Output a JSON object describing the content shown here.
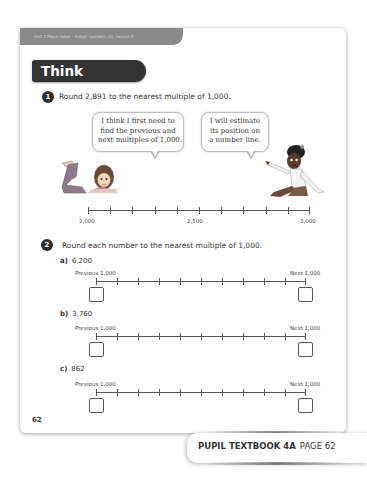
{
  "header": {
    "unit_label": "Unit 2  Place value – 4-digit numbers (2), Lesson 5",
    "section_title": "Think together"
  },
  "question1": {
    "number": "1",
    "text": "Round 2,891 to the nearest multiple of 1,000.",
    "bubble_left": {
      "lines": [
        "I think I first need to",
        "find the previous and",
        "next multiples of 1,000."
      ]
    },
    "bubble_right": {
      "lines": [
        "I will estimate",
        "its position on",
        "a number line."
      ]
    },
    "number_line": {
      "start_label": "2,000",
      "mid_label": "2,500",
      "end_label": "3,000",
      "tick_count": 11
    },
    "characters": [
      "girl-lying-character",
      "girl-pointing-character"
    ]
  },
  "question2": {
    "number": "2",
    "text": "Round each number to the nearest multiple of 1,000.",
    "parts": [
      {
        "letter": "a)",
        "value": "6,200",
        "previous_label": "Previous 1,000",
        "next_label": "Next 1,000",
        "tick_count": 11
      },
      {
        "letter": "b)",
        "value": "3,760",
        "previous_label": "Previous 1,000",
        "next_label": "Next 1,000",
        "tick_count": 11
      },
      {
        "letter": "c)",
        "value": "862",
        "previous_label": "Previous 1,000",
        "next_label": "Next 1,000",
        "tick_count": 11
      }
    ]
  },
  "page": {
    "number": "62"
  },
  "footer": {
    "book": "PUPIL TEXTBOOK 4A",
    "page": "PAGE 62"
  },
  "colors": {
    "banner_dark": "#333333",
    "unit_banner": "#8a8a8a",
    "text": "#333333",
    "page_bg": "#ffffff"
  }
}
